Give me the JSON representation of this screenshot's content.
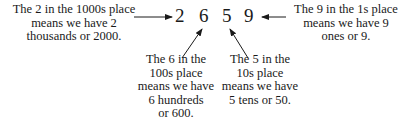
{
  "number": {
    "digits": [
      "2",
      "6",
      "5",
      "9"
    ]
  },
  "annotations": {
    "thousands": {
      "line1": "The 2 in the 1000s place",
      "line2": "means we have 2",
      "line3": "thousands or 2000."
    },
    "hundreds": {
      "line1": "The 6 in the",
      "line2": "100s place",
      "line3": "means we have",
      "line4": "6 hundreds",
      "line5": "or 600."
    },
    "tens": {
      "line1": "The 5 in the",
      "line2": "10s place",
      "line3": "means we have",
      "line4": "5 tens or 50."
    },
    "ones": {
      "line1": "The 9 in the 1s place",
      "line2": "means we have 9",
      "line3": "ones or 9."
    }
  }
}
